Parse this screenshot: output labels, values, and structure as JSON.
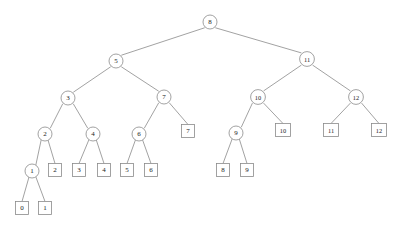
{
  "figure": {
    "background_color": "#ffffff",
    "stroke_color": "#8a8a8a",
    "label_color": "#1a1a1a"
  },
  "chart_data": {
    "type": "diagram",
    "diagram_kind": "binary-tree",
    "title": "",
    "node_shapes": {
      "internal": "circle",
      "leaf": "square"
    },
    "nodes": [
      {
        "id": "n8",
        "label": "8",
        "shape": "circle",
        "x": 210,
        "y": 22,
        "r": 7.0,
        "depth": 0
      },
      {
        "id": "n5",
        "label": "5",
        "shape": "circle",
        "x": 116,
        "y": 61,
        "r": 7.0,
        "depth": 1
      },
      {
        "id": "n11",
        "label": "11",
        "shape": "circle",
        "x": 307,
        "y": 59,
        "r": 7.4,
        "depth": 1
      },
      {
        "id": "n3",
        "label": "3",
        "shape": "circle",
        "x": 68,
        "y": 98,
        "r": 7.0,
        "depth": 2
      },
      {
        "id": "n7",
        "label": "7",
        "shape": "circle",
        "x": 164,
        "y": 97,
        "r": 7.0,
        "depth": 2
      },
      {
        "id": "n10",
        "label": "10",
        "shape": "circle",
        "x": 258,
        "y": 97,
        "r": 7.4,
        "depth": 2
      },
      {
        "id": "n12",
        "label": "12",
        "shape": "circle",
        "x": 356,
        "y": 97,
        "r": 7.4,
        "depth": 2
      },
      {
        "id": "n2",
        "label": "2",
        "shape": "circle",
        "x": 45,
        "y": 134,
        "r": 7.0,
        "depth": 3
      },
      {
        "id": "n4",
        "label": "4",
        "shape": "circle",
        "x": 93,
        "y": 134,
        "r": 7.0,
        "depth": 3
      },
      {
        "id": "n6",
        "label": "6",
        "shape": "circle",
        "x": 139,
        "y": 134,
        "r": 7.0,
        "depth": 3
      },
      {
        "id": "n9",
        "label": "9",
        "shape": "circle",
        "x": 236,
        "y": 133,
        "r": 7.0,
        "depth": 3
      },
      {
        "id": "n1",
        "label": "1",
        "shape": "circle",
        "x": 32,
        "y": 171,
        "r": 7.0,
        "depth": 4
      },
      {
        "id": "l7",
        "label": "7",
        "shape": "square",
        "x": 188,
        "y": 131,
        "w": 13,
        "h": 13,
        "depth": 3
      },
      {
        "id": "l10",
        "label": "10",
        "shape": "square",
        "x": 283,
        "y": 130,
        "w": 15,
        "h": 13,
        "depth": 3
      },
      {
        "id": "l11",
        "label": "11",
        "shape": "square",
        "x": 331,
        "y": 130,
        "w": 15,
        "h": 13,
        "depth": 3
      },
      {
        "id": "l12",
        "label": "12",
        "shape": "square",
        "x": 379,
        "y": 130,
        "w": 15,
        "h": 13,
        "depth": 3
      },
      {
        "id": "l2",
        "label": "2",
        "shape": "square",
        "x": 55,
        "y": 170,
        "w": 13,
        "h": 13,
        "depth": 4
      },
      {
        "id": "l3",
        "label": "3",
        "shape": "square",
        "x": 79,
        "y": 170,
        "w": 13,
        "h": 13,
        "depth": 4
      },
      {
        "id": "l4",
        "label": "4",
        "shape": "square",
        "x": 104,
        "y": 170,
        "w": 13,
        "h": 13,
        "depth": 4
      },
      {
        "id": "l5",
        "label": "5",
        "shape": "square",
        "x": 127,
        "y": 170,
        "w": 13,
        "h": 13,
        "depth": 4
      },
      {
        "id": "l6",
        "label": "6",
        "shape": "square",
        "x": 151,
        "y": 170,
        "w": 13,
        "h": 13,
        "depth": 4
      },
      {
        "id": "l8",
        "label": "8",
        "shape": "square",
        "x": 223,
        "y": 170,
        "w": 13,
        "h": 13,
        "depth": 4
      },
      {
        "id": "l9",
        "label": "9",
        "shape": "square",
        "x": 247,
        "y": 170,
        "w": 13,
        "h": 13,
        "depth": 4
      },
      {
        "id": "l0",
        "label": "0",
        "shape": "square",
        "x": 22,
        "y": 208,
        "w": 13,
        "h": 13,
        "depth": 5
      },
      {
        "id": "l1",
        "label": "1",
        "shape": "square",
        "x": 45,
        "y": 208,
        "w": 13,
        "h": 13,
        "depth": 5
      }
    ],
    "edges": [
      {
        "from": "n8",
        "to": "n5"
      },
      {
        "from": "n8",
        "to": "n11"
      },
      {
        "from": "n5",
        "to": "n3"
      },
      {
        "from": "n5",
        "to": "n7"
      },
      {
        "from": "n11",
        "to": "n10"
      },
      {
        "from": "n11",
        "to": "n12"
      },
      {
        "from": "n3",
        "to": "n2"
      },
      {
        "from": "n3",
        "to": "n4"
      },
      {
        "from": "n7",
        "to": "n6"
      },
      {
        "from": "n7",
        "to": "l7"
      },
      {
        "from": "n10",
        "to": "n9"
      },
      {
        "from": "n10",
        "to": "l10"
      },
      {
        "from": "n12",
        "to": "l11"
      },
      {
        "from": "n12",
        "to": "l12"
      },
      {
        "from": "n2",
        "to": "n1"
      },
      {
        "from": "n2",
        "to": "l2"
      },
      {
        "from": "n4",
        "to": "l3"
      },
      {
        "from": "n4",
        "to": "l4"
      },
      {
        "from": "n6",
        "to": "l5"
      },
      {
        "from": "n6",
        "to": "l6"
      },
      {
        "from": "n9",
        "to": "l8"
      },
      {
        "from": "n9",
        "to": "l9"
      },
      {
        "from": "n1",
        "to": "l0"
      },
      {
        "from": "n1",
        "to": "l1"
      }
    ]
  }
}
